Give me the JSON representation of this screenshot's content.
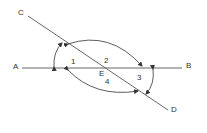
{
  "diagram": {
    "type": "intersecting-lines-angles",
    "points": {
      "A": "A",
      "B": "B",
      "C": "C",
      "D": "D",
      "E": "E"
    },
    "angles": {
      "a1": "1",
      "a2": "2",
      "a3": "3",
      "a4": "4"
    },
    "lines": [
      "AB",
      "CD"
    ],
    "arcs": [
      "angle-arc-left-small",
      "angle-arc-upper-large",
      "angle-arc-lower-large",
      "angle-arc-right-small"
    ],
    "colors": {
      "stroke": "#333333",
      "background": "#ffffff"
    }
  }
}
